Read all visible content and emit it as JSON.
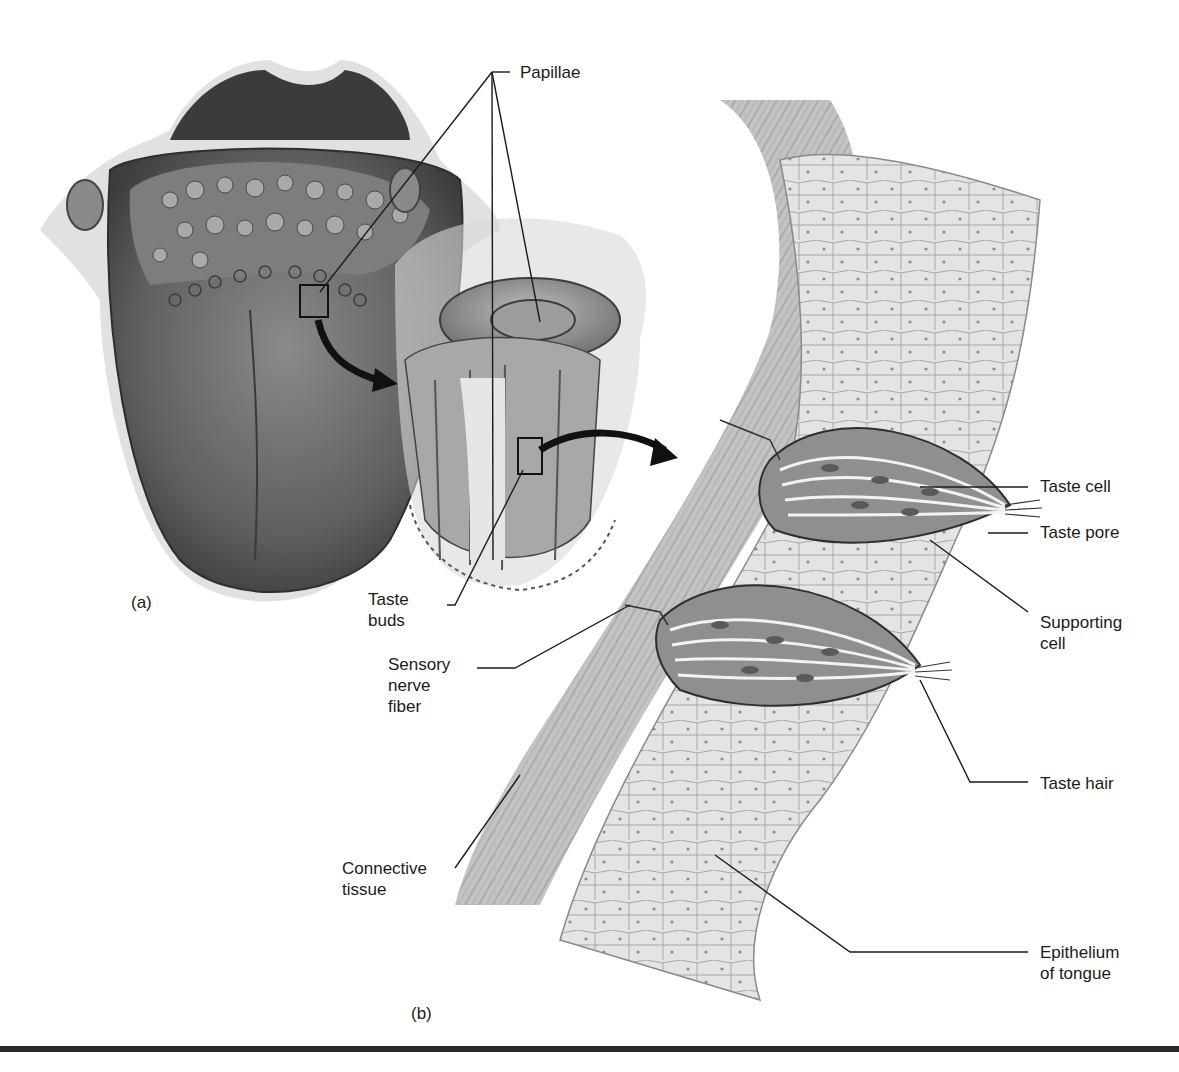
{
  "figure": {
    "panel_a_label": "(a)",
    "panel_b_label": "(b)",
    "labels": {
      "papillae": "Papillae",
      "taste_buds": "Taste\nbuds",
      "sensory_nerve_fiber": "Sensory\nnerve\nfiber",
      "connective_tissue": "Connective\ntissue",
      "taste_cell": "Taste cell",
      "taste_pore": "Taste pore",
      "supporting_cell": "Supporting\ncell",
      "taste_hair": "Taste hair",
      "epithelium_of_tongue": "Epithelium\nof tongue"
    },
    "colors": {
      "background": "#ffffff",
      "ink": "#1b1b1b",
      "tissue_dark": "#5a5a5a",
      "tissue_mid": "#9a9a9a",
      "tissue_light": "#d9d9d9",
      "rule": "#2a2a2a"
    }
  }
}
